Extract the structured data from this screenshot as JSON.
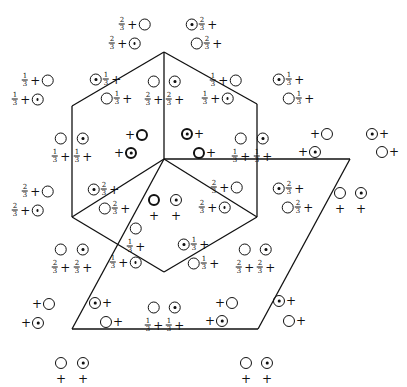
{
  "diagram": {
    "lines": [
      {
        "from": [
          164,
          52
        ],
        "to": [
          257,
          104
        ]
      },
      {
        "from": [
          257,
          104
        ],
        "to": [
          257,
          217
        ]
      },
      {
        "from": [
          257,
          217
        ],
        "to": [
          164,
          272
        ]
      },
      {
        "from": [
          164,
          272
        ],
        "to": [
          72,
          217
        ]
      },
      {
        "from": [
          72,
          217
        ],
        "to": [
          72,
          106
        ]
      },
      {
        "from": [
          72,
          106
        ],
        "to": [
          164,
          52
        ]
      },
      {
        "from": [
          164,
          52
        ],
        "to": [
          164,
          159
        ]
      },
      {
        "from": [
          164,
          159
        ],
        "to": [
          72,
          217
        ]
      },
      {
        "from": [
          164,
          159
        ],
        "to": [
          257,
          217
        ]
      },
      {
        "from": [
          164,
          159
        ],
        "to": [
          350,
          159
        ]
      },
      {
        "from": [
          350,
          159
        ],
        "to": [
          258,
          329
        ]
      },
      {
        "from": [
          258,
          329
        ],
        "to": [
          72,
          329
        ]
      },
      {
        "from": [
          72,
          329
        ],
        "to": [
          164,
          159
        ]
      }
    ],
    "labels": [
      {
        "x": 134,
        "y": 24,
        "parts": [
          "f:2/3",
          "+",
          "c"
        ]
      },
      {
        "x": 124,
        "y": 43,
        "parts": [
          "f:2/3",
          "+",
          "d"
        ]
      },
      {
        "x": 202,
        "y": 24,
        "parts": [
          "d",
          "f:2/3",
          "+"
        ]
      },
      {
        "x": 207,
        "y": 43,
        "parts": [
          "c",
          "f:2/3",
          "+"
        ]
      },
      {
        "x": 37,
        "y": 80,
        "parts": [
          "f:1/3",
          "+",
          "c"
        ]
      },
      {
        "x": 27,
        "y": 99,
        "parts": [
          "f:1/3",
          "+",
          "d"
        ]
      },
      {
        "x": 106,
        "y": 79,
        "parts": [
          "d",
          "f:1/3",
          "+"
        ]
      },
      {
        "x": 117,
        "y": 98,
        "parts": [
          "c",
          "f:1/3",
          "+"
        ]
      },
      {
        "x": 154,
        "y": 91,
        "col": true,
        "parts": [
          "c",
          "f:2/3",
          "+"
        ]
      },
      {
        "x": 175,
        "y": 91,
        "col": true,
        "parts": [
          "d",
          "f:2/3",
          "+"
        ]
      },
      {
        "x": 225,
        "y": 80,
        "parts": [
          "f:1/3",
          "+",
          "c"
        ]
      },
      {
        "x": 217,
        "y": 98,
        "parts": [
          "f:1/3",
          "+",
          "d"
        ]
      },
      {
        "x": 289,
        "y": 79,
        "parts": [
          "d",
          "f:1/3",
          "+"
        ]
      },
      {
        "x": 299,
        "y": 98,
        "parts": [
          "c",
          "f:1/3",
          "+"
        ]
      },
      {
        "x": 61,
        "y": 148,
        "col": true,
        "parts": [
          "c",
          "f:1/3",
          "+"
        ]
      },
      {
        "x": 83,
        "y": 148,
        "col": true,
        "parts": [
          "d",
          "f:1/3",
          "+"
        ]
      },
      {
        "x": 136,
        "y": 135,
        "parts": [
          "+",
          "C"
        ]
      },
      {
        "x": 125,
        "y": 153,
        "parts": [
          "+",
          "D"
        ]
      },
      {
        "x": 193,
        "y": 134,
        "parts": [
          "D",
          "+"
        ]
      },
      {
        "x": 205,
        "y": 153,
        "parts": [
          "C",
          "+"
        ]
      },
      {
        "x": 241,
        "y": 148,
        "col": true,
        "parts": [
          "c",
          "f:1/3",
          "+"
        ]
      },
      {
        "x": 263,
        "y": 148,
        "col": true,
        "parts": [
          "d",
          "f:1/3",
          "+"
        ]
      },
      {
        "x": 321,
        "y": 134,
        "parts": [
          "+",
          "c"
        ]
      },
      {
        "x": 309,
        "y": 152,
        "parts": [
          "+",
          "d"
        ]
      },
      {
        "x": 378,
        "y": 134,
        "parts": [
          "d",
          "+"
        ]
      },
      {
        "x": 388,
        "y": 152,
        "parts": [
          "c",
          "+"
        ]
      },
      {
        "x": 37,
        "y": 191,
        "parts": [
          "f:2/3",
          "+",
          "c"
        ]
      },
      {
        "x": 27,
        "y": 210,
        "parts": [
          "f:2/3",
          "+",
          "d"
        ]
      },
      {
        "x": 104,
        "y": 189,
        "parts": [
          "d",
          "f:2/3",
          "+"
        ]
      },
      {
        "x": 115,
        "y": 208,
        "parts": [
          "c",
          "f:2/3",
          "+"
        ]
      },
      {
        "x": 154,
        "y": 208,
        "col": true,
        "parts": [
          "C",
          "+"
        ]
      },
      {
        "x": 176,
        "y": 208,
        "col": true,
        "parts": [
          "d",
          "+"
        ]
      },
      {
        "x": 226,
        "y": 187,
        "parts": [
          "f:2/3",
          "+",
          "c"
        ]
      },
      {
        "x": 214,
        "y": 207,
        "parts": [
          "f:2/3",
          "+",
          "d"
        ]
      },
      {
        "x": 289,
        "y": 188,
        "parts": [
          "d",
          "f:2/3",
          "+"
        ]
      },
      {
        "x": 298,
        "y": 207,
        "parts": [
          "c",
          "f:2/3",
          "+"
        ]
      },
      {
        "x": 340,
        "y": 201,
        "col": true,
        "parts": [
          "c",
          "+"
        ]
      },
      {
        "x": 361,
        "y": 201,
        "col": true,
        "parts": [
          "d",
          "+"
        ]
      },
      {
        "x": 136,
        "y": 238,
        "col": true,
        "parts": [
          "f:1/3",
          "+",
          "c"
        ]
      },
      {
        "x": 125,
        "y": 262,
        "parts": [
          "f:1/3",
          "+",
          "d"
        ]
      },
      {
        "x": 194,
        "y": 244,
        "parts": [
          "d",
          "f:1/3",
          "+"
        ]
      },
      {
        "x": 204,
        "y": 263,
        "parts": [
          "c",
          "f:1/3",
          "+"
        ]
      },
      {
        "x": 61,
        "y": 259,
        "col": true,
        "parts": [
          "c",
          "f:2/3",
          "+"
        ]
      },
      {
        "x": 83,
        "y": 259,
        "col": true,
        "parts": [
          "d",
          "f:2/3",
          "+"
        ]
      },
      {
        "x": 245,
        "y": 259,
        "col": true,
        "parts": [
          "c",
          "f:2/3",
          "+"
        ]
      },
      {
        "x": 266,
        "y": 259,
        "col": true,
        "parts": [
          "d",
          "f:2/3",
          "+"
        ]
      },
      {
        "x": 43,
        "y": 304,
        "parts": [
          "+",
          "c"
        ]
      },
      {
        "x": 32,
        "y": 323,
        "parts": [
          "+",
          "d"
        ]
      },
      {
        "x": 101,
        "y": 303,
        "parts": [
          "d",
          "+"
        ]
      },
      {
        "x": 112,
        "y": 322,
        "parts": [
          "c",
          "+"
        ]
      },
      {
        "x": 154,
        "y": 317,
        "col": true,
        "parts": [
          "c",
          "f:1/3",
          "+"
        ]
      },
      {
        "x": 175,
        "y": 317,
        "col": true,
        "parts": [
          "d",
          "f:1/3",
          "+"
        ]
      },
      {
        "x": 226,
        "y": 303,
        "parts": [
          "+",
          "c"
        ]
      },
      {
        "x": 216,
        "y": 321,
        "parts": [
          "+",
          "d"
        ]
      },
      {
        "x": 285,
        "y": 301,
        "parts": [
          "d",
          "+"
        ]
      },
      {
        "x": 295,
        "y": 321,
        "parts": [
          "c",
          "+"
        ]
      },
      {
        "x": 61,
        "y": 371,
        "col": true,
        "parts": [
          "c",
          "+"
        ]
      },
      {
        "x": 83,
        "y": 371,
        "col": true,
        "parts": [
          "d",
          "+"
        ]
      },
      {
        "x": 246,
        "y": 371,
        "col": true,
        "parts": [
          "c",
          "+"
        ]
      },
      {
        "x": 267,
        "y": 371,
        "col": true,
        "parts": [
          "d",
          "+"
        ]
      }
    ]
  }
}
